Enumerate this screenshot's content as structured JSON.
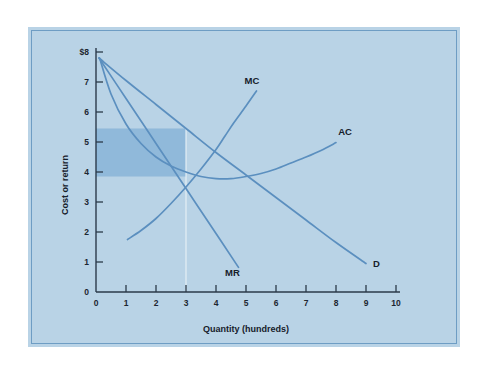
{
  "figure": {
    "plate_color": "#b9d3e6",
    "rule_color": "#6e9dc4",
    "curve_color": "#5b8fbf",
    "shade_color": "#8cb6d9",
    "axis_color": "#2b3a4a"
  },
  "chart_data": {
    "type": "line",
    "title": "",
    "xlabel": "Quantity (hundreds)",
    "ylabel": "Cost or return",
    "xlim": [
      0,
      10
    ],
    "ylim": [
      0,
      8
    ],
    "grid": false,
    "legend": "inline-curve-labels",
    "xticks": [
      "0",
      "1",
      "2",
      "3",
      "4",
      "5",
      "6",
      "7",
      "8",
      "9",
      "10"
    ],
    "xtick_values": [
      0,
      1,
      2,
      3,
      4,
      5,
      6,
      7,
      8,
      9,
      10
    ],
    "yticks": [
      "0",
      "1",
      "2",
      "3",
      "4",
      "5",
      "6",
      "7",
      "$8"
    ],
    "ytick_values": [
      0,
      1,
      2,
      3,
      4,
      5,
      6,
      7,
      8
    ],
    "series": [
      {
        "name": "D",
        "label": "D",
        "label_x": 9.35,
        "label_y": 0.85,
        "points": [
          [
            0.1,
            7.8
          ],
          [
            1,
            7.05
          ],
          [
            2,
            6.25
          ],
          [
            3,
            5.45
          ],
          [
            4,
            4.65
          ],
          [
            5,
            3.9
          ],
          [
            6,
            3.15
          ],
          [
            7,
            2.4
          ],
          [
            8,
            1.65
          ],
          [
            9.0,
            0.95
          ]
        ]
      },
      {
        "name": "MR",
        "label": "MR",
        "label_x": 4.55,
        "label_y": 0.55,
        "points": [
          [
            0.1,
            7.8
          ],
          [
            1,
            6.45
          ],
          [
            2,
            4.95
          ],
          [
            3,
            3.45
          ],
          [
            4,
            1.95
          ],
          [
            4.75,
            0.82
          ]
        ]
      },
      {
        "name": "AC",
        "label": "AC",
        "label_x": 8.3,
        "label_y": 5.25,
        "points": [
          [
            0.12,
            7.8
          ],
          [
            0.5,
            6.6
          ],
          [
            1,
            5.6
          ],
          [
            1.5,
            4.95
          ],
          [
            2,
            4.5
          ],
          [
            2.5,
            4.2
          ],
          [
            3,
            4.0
          ],
          [
            3.5,
            3.85
          ],
          [
            4,
            3.78
          ],
          [
            4.5,
            3.78
          ],
          [
            5,
            3.85
          ],
          [
            5.5,
            3.95
          ],
          [
            6,
            4.1
          ],
          [
            6.5,
            4.3
          ],
          [
            7,
            4.5
          ],
          [
            7.5,
            4.72
          ],
          [
            8.0,
            4.98
          ]
        ]
      },
      {
        "name": "MC",
        "label": "MC",
        "label_x": 5.2,
        "label_y": 6.95,
        "points": [
          [
            1.05,
            1.75
          ],
          [
            1.5,
            2.05
          ],
          [
            2,
            2.45
          ],
          [
            2.5,
            2.95
          ],
          [
            3,
            3.5
          ],
          [
            3.5,
            4.1
          ],
          [
            4,
            4.75
          ],
          [
            4.3,
            5.2
          ],
          [
            4.6,
            5.65
          ],
          [
            5.0,
            6.2
          ],
          [
            5.35,
            6.7
          ]
        ]
      }
    ],
    "annotations": [
      {
        "name": "profit-rectangle",
        "type": "rect",
        "x0": 0,
        "x1": 3.0,
        "y0": 3.85,
        "y1": 5.45,
        "color": "#8cb6d9"
      },
      {
        "name": "quantity-drop-line",
        "type": "vline",
        "x": 3.0,
        "y0": 0,
        "y1": 5.45
      }
    ]
  }
}
